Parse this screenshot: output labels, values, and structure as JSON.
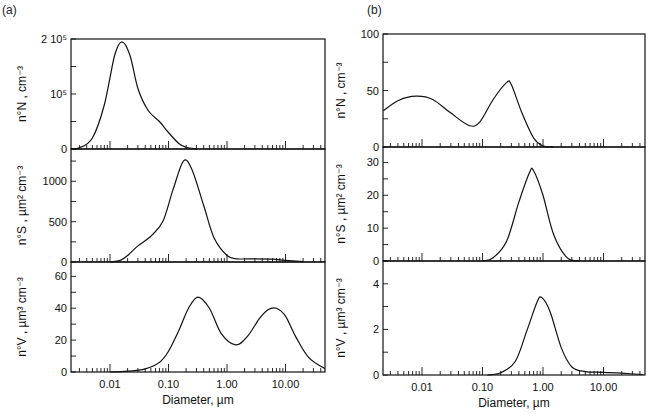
{
  "figure": {
    "panel_a_label": "(a)",
    "panel_b_label": "(b)"
  },
  "chart_data": [
    {
      "id": "a",
      "type": "line",
      "title": "(a)",
      "xlabel": "Diameter, µm",
      "xscale": "log",
      "xlim": [
        0.002,
        50
      ],
      "xticks": [
        "0.01",
        "0.10",
        "1.00",
        "10.00"
      ],
      "subplots": [
        {
          "ylabel": "n°N , cm−3",
          "ylim": [
            0,
            200000
          ],
          "yticks": [
            "0",
            "10^5",
            "2 10^5"
          ],
          "series": [
            {
              "name": "number distribution",
              "x": [
                0.002,
                0.003,
                0.005,
                0.008,
                0.012,
                0.016,
                0.022,
                0.03,
                0.045,
                0.07,
                0.1,
                0.15,
                0.2,
                0.3
              ],
              "y": [
                0,
                2000,
                20000,
                80000,
                170000,
                195000,
                170000,
                110000,
                70000,
                50000,
                30000,
                10000,
                3000,
                0
              ]
            }
          ]
        },
        {
          "ylabel": "n°S , µm2 cm−3",
          "ylim": [
            0,
            1400
          ],
          "yticks": [
            "0",
            "500",
            "1000"
          ],
          "series": [
            {
              "name": "surface distribution",
              "x": [
                0.01,
                0.015,
                0.02,
                0.03,
                0.05,
                0.08,
                0.12,
                0.18,
                0.25,
                0.4,
                0.6,
                1.0,
                1.5,
                3,
                6,
                10,
                20
              ],
              "y": [
                0,
                20,
                80,
                200,
                320,
                500,
                900,
                1250,
                1150,
                700,
                300,
                80,
                40,
                40,
                35,
                20,
                5
              ]
            }
          ]
        },
        {
          "ylabel": "n°V , µm3 cm−3",
          "ylim": [
            0,
            69
          ],
          "yticks": [
            "0",
            "20",
            "40",
            "60"
          ],
          "series": [
            {
              "name": "volume distribution",
              "x": [
                0.01,
                0.02,
                0.04,
                0.07,
                0.1,
                0.15,
                0.22,
                0.32,
                0.5,
                0.8,
                1.4,
                2.2,
                3.5,
                5,
                7,
                10,
                15,
                25,
                50
              ],
              "y": [
                0,
                0.5,
                2,
                6,
                13,
                26,
                40,
                47,
                40,
                24,
                17,
                22,
                33,
                39,
                40,
                35,
                22,
                9,
                2
              ]
            }
          ]
        }
      ]
    },
    {
      "id": "b",
      "type": "line",
      "title": "(b)",
      "xlabel": "Diameter, µm",
      "xscale": "log",
      "xlim": [
        0.0023,
        45
      ],
      "xticks": [
        "0.01",
        "0.10",
        "1.00",
        "10.00"
      ],
      "subplots": [
        {
          "ylabel": "n°N , cm−3",
          "ylim": [
            0,
            100
          ],
          "yticks": [
            "0",
            "50",
            "100"
          ],
          "series": [
            {
              "name": "number distribution",
              "x": [
                0.0023,
                0.004,
                0.008,
                0.015,
                0.03,
                0.06,
                0.09,
                0.15,
                0.25,
                0.3,
                0.45,
                0.7,
                1.0,
                1.5
              ],
              "y": [
                32,
                41,
                45,
                42,
                30,
                19,
                22,
                42,
                57,
                55,
                30,
                8,
                1,
                0
              ]
            }
          ]
        },
        {
          "ylabel": "n°S , µm2 cm−3",
          "ylim": [
            0,
            34.7
          ],
          "yticks": [
            "0",
            "10",
            "20",
            "30"
          ],
          "series": [
            {
              "name": "surface distribution",
              "x": [
                0.1,
                0.15,
                0.25,
                0.4,
                0.6,
                0.7,
                1.0,
                1.5,
                2.5,
                4
              ],
              "y": [
                0,
                1,
                6,
                18,
                27,
                27.5,
                20,
                8,
                1,
                0
              ]
            }
          ]
        },
        {
          "ylabel": "n°V , µm3 cm−3",
          "ylim": [
            0,
            5
          ],
          "yticks": [
            "0",
            "2",
            "4"
          ],
          "series": [
            {
              "name": "volume distribution",
              "x": [
                0.12,
                0.2,
                0.35,
                0.55,
                0.8,
                0.95,
                1.3,
                2,
                3,
                5,
                10,
                20,
                45
              ],
              "y": [
                0,
                0.1,
                0.6,
                2.0,
                3.2,
                3.4,
                2.8,
                1.2,
                0.35,
                0.15,
                0.12,
                0.08,
                0.02
              ]
            }
          ]
        }
      ]
    }
  ],
  "labels": {
    "a": {
      "panel1_ylabel": "n°N , cm⁻³",
      "panel2_ylabel": "n°S , µm² cm⁻³",
      "panel3_ylabel": "n°V , µm³ cm⁻³",
      "panel1_yticks": [
        "0",
        "10⁵",
        "2 10⁵"
      ],
      "panel2_yticks": [
        "0",
        "500",
        "1000"
      ],
      "panel3_yticks": [
        "0",
        "20",
        "40",
        "60"
      ],
      "xticks": [
        "0.01",
        "0.10",
        "1.00",
        "10.00"
      ],
      "xlabel": "Diameter,  µm"
    },
    "b": {
      "panel1_ylabel": "n°N , cm⁻³",
      "panel2_ylabel": "n°S , µm² cm⁻³",
      "panel3_ylabel": "n°V , µm³ cm⁻³",
      "panel1_yticks": [
        "0",
        "50",
        "100"
      ],
      "panel2_yticks": [
        "0",
        "10",
        "20",
        "30"
      ],
      "panel3_yticks": [
        "0",
        "2",
        "4"
      ],
      "xticks": [
        "0.01",
        "0.10",
        "1.00",
        "10.00"
      ],
      "xlabel": "Diameter,  µm"
    }
  }
}
